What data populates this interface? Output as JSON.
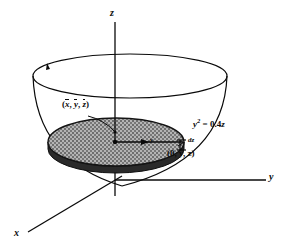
{
  "figure": {
    "background_color": "#ffffff",
    "line_color": "#0a0a0a",
    "disk_fill_color": "#9a9a9a",
    "disk_edge_color": "#1a1a1a",
    "width": 283,
    "height": 248
  },
  "axes": {
    "z_label": "z",
    "y_label": "y",
    "x_label": "x",
    "origin": {
      "x": 115,
      "y": 180
    }
  },
  "labels": {
    "centroid": {
      "open": "(",
      "x_bar": "x",
      "sep1": ", ",
      "y_bar": "y",
      "sep2": ", ",
      "z_bar": "z",
      "close": ")",
      "text": "(x, y, z)"
    },
    "equation": {
      "base": "y",
      "exponent": "2",
      "relation": " = 0.4",
      "variable": "z",
      "text": "y2 = 0.4z"
    },
    "thickness": {
      "text": "dz"
    },
    "point": {
      "text": "(0, y, z)"
    },
    "radius_tick": {
      "text": "y"
    }
  },
  "geometry": {
    "top_rim": {
      "cx": 130,
      "cy": 76,
      "rx": 97,
      "ry": 22
    },
    "disk": {
      "cx": 116,
      "cy": 142,
      "rx": 68,
      "ry": 24,
      "thickness": 7
    },
    "bowl_bottom_y": 186,
    "z_axis": {
      "x": 115,
      "top": 22,
      "bottom": 196
    },
    "y_axis": {
      "from_x": 115,
      "to_x": 268,
      "y": 180
    },
    "x_axis": {
      "from_x": 115,
      "from_y": 180,
      "to_x": 28,
      "to_y": 232
    }
  }
}
